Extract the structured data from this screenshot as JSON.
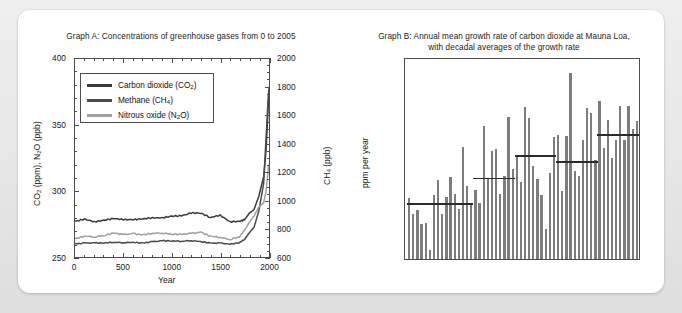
{
  "graph_a": {
    "title": "Graph A: Concentrations of greenhouse gases from 0 to 2005",
    "y_left_label": "CO2 (ppm), N2O (ppb)",
    "y_right_label": "CH4 (ppb)",
    "x_label": "Year",
    "y_left_ticks": [
      "250",
      "300",
      "350",
      "400"
    ],
    "y_right_ticks": [
      "600",
      "800",
      "1000",
      "1200",
      "1400",
      "1600",
      "1800",
      "2000"
    ],
    "x_ticks": [
      "0",
      "500",
      "1000",
      "1500",
      "2000"
    ],
    "legend": [
      {
        "label": "Carbon dioxide (CO2)",
        "color": "#3a3a3a"
      },
      {
        "label": "Methane (CH4)",
        "color": "#4a4a4a"
      },
      {
        "label": "Nitrous oxide (N2O)",
        "color": "#a0a0a0"
      }
    ]
  },
  "graph_b": {
    "title": "Graph B: Annual mean growth rate of carbon dioxide at Mauna Loa, with decadal averages of the growth rate",
    "y_label": "ppm per year",
    "y_ticks": [
      "0.0",
      "0.5",
      "1.0",
      "1.5",
      "2.0",
      "2.5",
      "3.0"
    ],
    "x_ticks": [
      "1960",
      "1970",
      "1980",
      "1990",
      "2000",
      "2010"
    ],
    "bar_color": "#7d7d7d",
    "average_line_color": "#2b2b2b"
  },
  "chart_data": [
    {
      "type": "line",
      "title": "Graph A: Concentrations of greenhouse gases from 0 to 2005",
      "xlabel": "Year",
      "ylabel": "CO2 (ppm), N2O (ppb)",
      "ylabel_right": "CH4 (ppb)",
      "xlim": [
        0,
        2005
      ],
      "ylim": [
        250,
        400
      ],
      "ylim_right": [
        600,
        2000
      ],
      "grid": false,
      "legend_position": "upper-left",
      "x": [
        0,
        100,
        200,
        300,
        400,
        500,
        600,
        700,
        800,
        900,
        1000,
        1100,
        1200,
        1300,
        1400,
        1500,
        1600,
        1700,
        1750,
        1800,
        1850,
        1900,
        1950,
        1975,
        2000,
        2005
      ],
      "series": [
        {
          "name": "Carbon dioxide (CO2)",
          "axis": "left",
          "units": "ppm",
          "color": "#3a3a3a",
          "values": [
            277,
            279,
            277,
            278,
            279,
            278,
            278,
            279,
            280,
            280,
            281,
            281,
            283,
            283,
            280,
            282,
            277,
            277,
            278,
            283,
            286,
            296,
            311,
            331,
            369,
            379
          ]
        },
        {
          "name": "Methane (CH4)",
          "axis": "right",
          "units": "ppb",
          "color": "#4a4a4a",
          "values": [
            695,
            700,
            700,
            698,
            702,
            700,
            705,
            700,
            710,
            715,
            712,
            710,
            715,
            710,
            700,
            700,
            690,
            700,
            722,
            770,
            810,
            925,
            1120,
            1450,
            1760,
            1775
          ]
        },
        {
          "name": "Nitrous oxide (N2O)",
          "axis": "left",
          "units": "ppb",
          "color": "#a0a0a0",
          "values": [
            264,
            266,
            265,
            266,
            268,
            267,
            268,
            267,
            268,
            268,
            267,
            267,
            268,
            269,
            266,
            265,
            263,
            265,
            270,
            276,
            281,
            288,
            291,
            300,
            319,
            320
          ]
        }
      ]
    },
    {
      "type": "bar",
      "title": "Graph B: Annual mean growth rate of carbon dioxide at Mauna Loa, with decadal averages of the growth rate",
      "xlabel": "",
      "ylabel": "ppm per year",
      "xlim": [
        1958,
        2015
      ],
      "ylim": [
        0.0,
        3.2
      ],
      "grid": false,
      "categories": [
        1959,
        1960,
        1961,
        1962,
        1963,
        1964,
        1965,
        1966,
        1967,
        1968,
        1969,
        1970,
        1971,
        1972,
        1973,
        1974,
        1975,
        1976,
        1977,
        1978,
        1979,
        1980,
        1981,
        1982,
        1983,
        1984,
        1985,
        1986,
        1987,
        1988,
        1989,
        1990,
        1991,
        1992,
        1993,
        1994,
        1995,
        1996,
        1997,
        1998,
        1999,
        2000,
        2001,
        2002,
        2003,
        2004,
        2005,
        2006,
        2007,
        2008,
        2009,
        2010,
        2011,
        2012,
        2013,
        2014
      ],
      "values": [
        0.96,
        0.71,
        0.78,
        0.56,
        0.57,
        0.15,
        1.02,
        1.25,
        0.72,
        0.98,
        1.3,
        1.03,
        0.8,
        1.77,
        1.15,
        0.89,
        1.09,
        0.89,
        2.1,
        1.28,
        1.71,
        1.75,
        1.03,
        1.32,
        2.25,
        1.42,
        1.61,
        1.22,
        2.41,
        2.24,
        1.48,
        1.26,
        1.02,
        0.47,
        1.36,
        1.94,
        1.97,
        1.08,
        1.95,
        2.94,
        1.4,
        1.31,
        1.88,
        2.4,
        2.31,
        1.57,
        2.51,
        1.76,
        2.21,
        1.6,
        1.89,
        2.42,
        1.88,
        2.43,
        2.06,
        2.18
      ],
      "series": [
        {
          "name": "Annual mean growth rate",
          "values": [
            0.96,
            0.71,
            0.78,
            0.56,
            0.57,
            0.15,
            1.02,
            1.25,
            0.72,
            0.98,
            1.3,
            1.03,
            0.8,
            1.77,
            1.15,
            0.89,
            1.09,
            0.89,
            2.1,
            1.28,
            1.71,
            1.75,
            1.03,
            1.32,
            2.25,
            1.42,
            1.61,
            1.22,
            2.41,
            2.24,
            1.48,
            1.26,
            1.02,
            0.47,
            1.36,
            1.94,
            1.97,
            1.08,
            1.95,
            2.94,
            1.4,
            1.31,
            1.88,
            2.4,
            2.31,
            1.57,
            2.51,
            1.76,
            2.21,
            1.6,
            1.89,
            2.42,
            1.88,
            2.43,
            2.06,
            2.18
          ]
        }
      ],
      "decadal_averages": [
        {
          "start": 1959,
          "end": 1964,
          "value": 0.85
        },
        {
          "start": 1965,
          "end": 1974,
          "value": 0.85
        },
        {
          "start": 1975,
          "end": 1984,
          "value": 1.26
        },
        {
          "start": 1985,
          "end": 1994,
          "value": 1.61
        },
        {
          "start": 1995,
          "end": 2004,
          "value": 1.52
        },
        {
          "start": 2005,
          "end": 2014,
          "value": 1.95
        }
      ]
    }
  ]
}
